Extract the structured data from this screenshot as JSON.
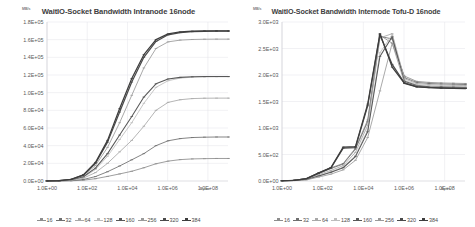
{
  "chart_data": [
    {
      "type": "line",
      "title": "WaitIO-Socket Bandwidth Intranode 16node",
      "xlabel": "Bytes",
      "ylabel": "MB/s",
      "xscale": "log",
      "grid": true,
      "legend_position": "bottom",
      "xlim": [
        1,
        1000000000
      ],
      "ylim": [
        0,
        180000
      ],
      "xticks": [
        "1.0E+00",
        "1.0E+02",
        "1.0E+04",
        "1.0E+06",
        "1.0E+08"
      ],
      "xtick_values": [
        1,
        100,
        10000,
        1000000,
        100000000
      ],
      "yticks": [
        "0.0E+00",
        "2.0E+04",
        "4.0E+04",
        "6.0E+04",
        "8.0E+04",
        "1.0E+05",
        "1.2E+05",
        "1.4E+05",
        "1.6E+05",
        "1.8E+05"
      ],
      "ytick_values": [
        0,
        20000,
        40000,
        60000,
        80000,
        100000,
        120000,
        140000,
        160000,
        180000
      ],
      "x": [
        1,
        4,
        16,
        64,
        256,
        1024,
        4096,
        16384,
        65536,
        262144,
        1048576,
        4194304,
        16777216,
        67108864,
        268435456,
        1073741824
      ],
      "series": [
        {
          "name": "16",
          "color": "#8d8d8d",
          "values": [
            20,
            70,
            260,
            900,
            2600,
            5200,
            8000,
            11000,
            15000,
            19500,
            22500,
            24200,
            25000,
            25300,
            25500,
            25500
          ]
        },
        {
          "name": "32",
          "color": "#6f6f6f",
          "values": [
            35,
            130,
            480,
            1700,
            5000,
            10500,
            17000,
            24000,
            31000,
            40000,
            45500,
            48000,
            49200,
            49600,
            49800,
            49800
          ]
        },
        {
          "name": "64",
          "color": "#a8a8a8",
          "values": [
            60,
            240,
            900,
            3200,
            9500,
            20000,
            33000,
            46000,
            62000,
            80000,
            89000,
            92000,
            93300,
            93700,
            93800,
            93800
          ]
        },
        {
          "name": "128",
          "color": "#bdbdbd",
          "values": [
            80,
            320,
            1200,
            4300,
            13000,
            28000,
            47000,
            66000,
            88000,
            106000,
            113500,
            116500,
            117500,
            117800,
            118000,
            118000
          ]
        },
        {
          "name": "160",
          "color": "#585858",
          "values": [
            90,
            360,
            1350,
            4800,
            14500,
            31000,
            52000,
            73000,
            95000,
            110000,
            115500,
            117300,
            118000,
            118200,
            118300,
            118300
          ]
        },
        {
          "name": "256",
          "color": "#9a9a9a",
          "values": [
            110,
            440,
            1650,
            5900,
            17500,
            38000,
            66000,
            97000,
            128000,
            150000,
            157500,
            159500,
            160200,
            160500,
            160600,
            160600
          ]
        },
        {
          "name": "320",
          "color": "#4a4a4a",
          "values": [
            125,
            500,
            1900,
            6700,
            20000,
            44000,
            78000,
            112000,
            140000,
            158000,
            165500,
            168000,
            169000,
            169400,
            169600,
            169600
          ]
        },
        {
          "name": "384",
          "color": "#3d3d3d",
          "values": [
            130,
            520,
            1980,
            7000,
            21000,
            46000,
            82000,
            116000,
            143000,
            160000,
            166500,
            168800,
            169600,
            169900,
            170000,
            170000
          ]
        }
      ]
    },
    {
      "type": "line",
      "title": "WaitIO-Socket Bandwidth Internode   Tofu-D 16node",
      "xlabel": "Bytes",
      "ylabel": "MB/s",
      "xscale": "log",
      "grid": true,
      "legend_position": "bottom",
      "xlim": [
        1,
        1000000000
      ],
      "ylim": [
        0,
        3000
      ],
      "xticks": [
        "1.0E+00",
        "1.0E+02",
        "1.0E+04",
        "1.0E+06",
        "1.0E+08"
      ],
      "xtick_values": [
        1,
        100,
        10000,
        1000000,
        100000000
      ],
      "yticks": [
        "0.0E+00",
        "5.0E+02",
        "1.0E+03",
        "1.5E+03",
        "2.0E+03",
        "2.5E+03",
        "3.0E+03"
      ],
      "ytick_values": [
        0,
        500,
        1000,
        1500,
        2000,
        2500,
        3000
      ],
      "x": [
        1,
        4,
        16,
        64,
        256,
        1024,
        4096,
        16384,
        65536,
        262144,
        1048576,
        4194304,
        16777216,
        67108864,
        268435456,
        1073741824
      ],
      "series": [
        {
          "name": "16",
          "color": "#8d8d8d",
          "values": [
            5,
            14,
            45,
            150,
            250,
            330,
            620,
            1150,
            2750,
            2600,
            1980,
            1880,
            1860,
            1850,
            1845,
            1840
          ]
        },
        {
          "name": "32",
          "color": "#6f6f6f",
          "values": [
            5,
            13,
            42,
            140,
            235,
            320,
            600,
            1120,
            2730,
            2680,
            1950,
            1860,
            1840,
            1830,
            1825,
            1820
          ]
        },
        {
          "name": "64",
          "color": "#a8a8a8",
          "values": [
            4,
            11,
            36,
            120,
            200,
            290,
            540,
            1050,
            2700,
            2780,
            1930,
            1840,
            1820,
            1810,
            1805,
            1800
          ]
        },
        {
          "name": "128",
          "color": "#bdbdbd",
          "values": [
            4,
            10,
            30,
            100,
            175,
            260,
            480,
            960,
            2420,
            2760,
            1900,
            1820,
            1800,
            1790,
            1785,
            1780
          ]
        },
        {
          "name": "160",
          "color": "#585858",
          "values": [
            4,
            10,
            28,
            95,
            165,
            250,
            460,
            930,
            2350,
            2720,
            1880,
            1800,
            1780,
            1775,
            1770,
            1765
          ]
        },
        {
          "name": "256",
          "color": "#9a9a9a",
          "values": [
            3,
            8,
            22,
            75,
            130,
            210,
            390,
            820,
            1700,
            2600,
            1860,
            1790,
            1770,
            1765,
            1760,
            1755
          ]
        },
        {
          "name": "320",
          "color": "#4a4a4a",
          "values": [
            5,
            13,
            44,
            148,
            248,
            620,
            630,
            1420,
            2760,
            2200,
            1850,
            1780,
            1765,
            1758,
            1752,
            1750
          ]
        },
        {
          "name": "384",
          "color": "#3d3d3d",
          "values": [
            5,
            14,
            46,
            152,
            252,
            640,
            650,
            1450,
            2780,
            2150,
            1840,
            1775,
            1760,
            1752,
            1748,
            1745
          ]
        }
      ]
    }
  ]
}
